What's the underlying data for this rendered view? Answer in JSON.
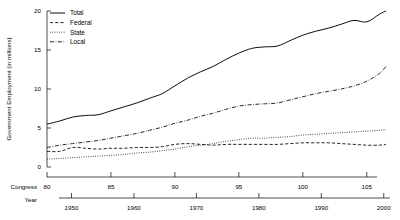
{
  "chart_data": {
    "type": "line",
    "title": "",
    "ylabel": "Government Employment (in millions)",
    "ylim": [
      0,
      20
    ],
    "yticks": [
      0,
      5,
      10,
      15,
      20
    ],
    "ytick_labels": [
      "0",
      "5",
      "10",
      "15",
      "20"
    ],
    "grid": false,
    "legend_position": "top-left",
    "x_axes": [
      {
        "name": "congress",
        "label": "Congress",
        "ticks": [
          80,
          85,
          90,
          95,
          100,
          105
        ],
        "tick_labels": [
          "80",
          "85",
          "90",
          "95",
          "100",
          "105"
        ],
        "range": [
          80,
          105.8
        ]
      },
      {
        "name": "year",
        "label": "Year",
        "ticks": [
          1950,
          1960,
          1970,
          1980,
          1990,
          2000
        ],
        "tick_labels": [
          "1950",
          "1960",
          "1970",
          "1980",
          "1990",
          "2000"
        ],
        "range": [
          1948,
          2001
        ]
      }
    ],
    "x": [
      1947,
      1949,
      1951,
      1953,
      1955,
      1957,
      1959,
      1961,
      1963,
      1965,
      1967,
      1969,
      1971,
      1973,
      1975,
      1977,
      1979,
      1981,
      1983,
      1985,
      1987,
      1989,
      1991,
      1993,
      1995,
      1997,
      1999,
      2000
    ],
    "congress_x": [
      80,
      81,
      82,
      83,
      84,
      85,
      86,
      87,
      88,
      89,
      90,
      91,
      92,
      93,
      94,
      95,
      96,
      97,
      98,
      99,
      100,
      101,
      102,
      103,
      104,
      105,
      106,
      106.5
    ],
    "series": [
      {
        "name": "Total",
        "style": "solid",
        "values": [
          5.5,
          5.9,
          6.4,
          6.6,
          6.7,
          7.2,
          7.7,
          8.2,
          8.8,
          9.4,
          10.4,
          11.4,
          12.2,
          12.9,
          13.8,
          14.6,
          15.2,
          15.4,
          15.5,
          16.2,
          16.9,
          17.4,
          17.8,
          18.3,
          18.8,
          18.6,
          19.6,
          20.0
        ]
      },
      {
        "name": "Federal",
        "style": "dashed",
        "values": [
          2.0,
          2.0,
          2.5,
          2.4,
          2.3,
          2.4,
          2.4,
          2.5,
          2.5,
          2.6,
          2.9,
          3.0,
          2.9,
          2.8,
          2.9,
          2.9,
          2.9,
          2.9,
          2.9,
          3.0,
          3.1,
          3.1,
          3.1,
          3.0,
          2.9,
          2.8,
          2.8,
          2.9
        ]
      },
      {
        "name": "State",
        "style": "dotted",
        "values": [
          1.0,
          1.1,
          1.2,
          1.3,
          1.4,
          1.5,
          1.6,
          1.8,
          1.9,
          2.1,
          2.3,
          2.6,
          2.8,
          3.0,
          3.3,
          3.5,
          3.7,
          3.7,
          3.8,
          3.9,
          4.1,
          4.2,
          4.3,
          4.4,
          4.5,
          4.6,
          4.7,
          4.8
        ]
      },
      {
        "name": "Local",
        "style": "dashdot",
        "values": [
          2.5,
          2.8,
          3.0,
          3.2,
          3.4,
          3.7,
          4.0,
          4.3,
          4.7,
          5.1,
          5.6,
          6.0,
          6.5,
          6.9,
          7.4,
          7.8,
          8.0,
          8.1,
          8.2,
          8.6,
          9.0,
          9.4,
          9.7,
          10.0,
          10.4,
          11.0,
          12.0,
          12.9
        ]
      }
    ],
    "legend": [
      {
        "label": "Total",
        "style": "solid"
      },
      {
        "label": "Federal",
        "style": "dashed"
      },
      {
        "label": "State",
        "style": "dotted"
      },
      {
        "label": "Local",
        "style": "dashdot"
      }
    ]
  }
}
